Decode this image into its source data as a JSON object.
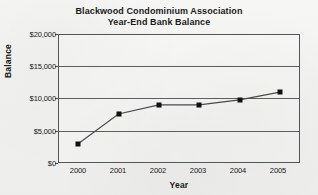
{
  "chart_data": {
    "type": "line",
    "title": "Blackwood Condominium Association",
    "subtitle": "Year-End Bank Balance",
    "xlabel": "Year",
    "ylabel": "Balance",
    "categories": [
      "2000",
      "2001",
      "2002",
      "2003",
      "2004",
      "2005"
    ],
    "values": [
      3000,
      7600,
      9000,
      9000,
      9800,
      11000
    ],
    "series": [
      {
        "name": "Year-End Bank Balance",
        "values": [
          3000,
          7600,
          9000,
          9000,
          9800,
          11000
        ]
      }
    ],
    "ylim": [
      0,
      20000
    ],
    "ytick_values": [
      0,
      5000,
      10000,
      15000,
      20000
    ],
    "ytick_labels": [
      "$0",
      "$5,000",
      "$10,000",
      "$15,000",
      "$20,000"
    ],
    "xtick_labels": [
      "2000",
      "2001",
      "2002",
      "2003",
      "2004",
      "2005"
    ],
    "grid": "horizontal",
    "legend": "none",
    "marker": "square",
    "line_color": "#4a4b4f",
    "marker_color": "#111111",
    "axis_color": "#55565a",
    "background_color": "#f3f3f1"
  },
  "meta": {
    "y_tick_0": "$0",
    "y_tick_1": "$5,000",
    "y_tick_2": "$10,000",
    "y_tick_3": "$15,000",
    "y_tick_4": "$20,000",
    "x_tick_0": "2000",
    "x_tick_1": "2001",
    "x_tick_2": "2002",
    "x_tick_3": "2003",
    "x_tick_4": "2004",
    "x_tick_5": "2005"
  }
}
